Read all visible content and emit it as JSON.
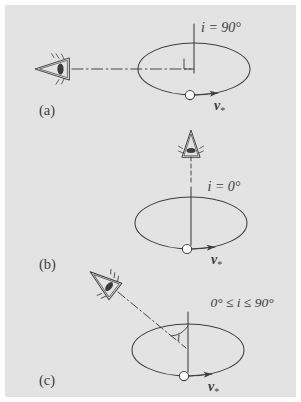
{
  "figure": {
    "background_color": "#e3e3e3",
    "page_color": "#ffffff",
    "ink_color": "#3d3d3d",
    "panel_count": 3
  },
  "panels": [
    {
      "id": "a",
      "panel_label": "(a)",
      "inclination_label": "i = 90°",
      "inclination_value": 90,
      "velocity_label": "v",
      "velocity_subscript": "*",
      "observer_position": "left",
      "observer_icon": "eye-icon",
      "sight_line_style": "dash-dot",
      "has_right_angle_marker": true,
      "has_angle_arc": false,
      "star_marker": "open-circle"
    },
    {
      "id": "b",
      "panel_label": "(b)",
      "inclination_label": "i = 0°",
      "inclination_value": 0,
      "velocity_label": "v",
      "velocity_subscript": "*",
      "observer_position": "top",
      "observer_icon": "eye-icon",
      "sight_line_style": "dashed",
      "has_right_angle_marker": false,
      "has_angle_arc": false,
      "star_marker": "open-circle"
    },
    {
      "id": "c",
      "panel_label": "(c)",
      "inclination_label": "0° ≤ i ≤ 90°",
      "inclination_value": null,
      "angle_arc_label": "i",
      "velocity_label": "v",
      "velocity_subscript": "*",
      "observer_position": "upper-left",
      "observer_icon": "eye-icon",
      "sight_line_style": "dash-dot",
      "has_right_angle_marker": false,
      "has_angle_arc": true,
      "star_marker": "open-circle"
    }
  ]
}
